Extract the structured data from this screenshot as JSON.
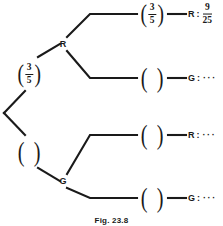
{
  "figure": {
    "caption": "Fig. 23.8",
    "stroke_color": "#1a1a1a",
    "background_color": "#ffffff"
  },
  "tree": {
    "root_branches": [
      {
        "id": "root-r",
        "probability": {
          "numerator": "3",
          "denominator": "5",
          "empty": false
        },
        "node_label": "R"
      },
      {
        "id": "root-g",
        "probability": {
          "numerator": "",
          "denominator": "",
          "empty": true
        },
        "node_label": "G"
      }
    ]
  },
  "outcomes": [
    {
      "id": "outcome-rr",
      "probability": {
        "numerator": "3",
        "denominator": "5",
        "empty": false
      },
      "letter": "R",
      "colon": ":",
      "result_numerator": "9",
      "result_denominator": "25",
      "result_dots": "",
      "has_result_fraction": true
    },
    {
      "id": "outcome-rg",
      "probability": {
        "numerator": "",
        "denominator": "",
        "empty": true
      },
      "letter": "G",
      "colon": ":",
      "result_numerator": "",
      "result_denominator": "",
      "result_dots": "···",
      "has_result_fraction": false
    },
    {
      "id": "outcome-gr",
      "probability": {
        "numerator": "",
        "denominator": "",
        "empty": true
      },
      "letter": "R",
      "colon": ":",
      "result_numerator": "",
      "result_denominator": "",
      "result_dots": "···",
      "has_result_fraction": false
    },
    {
      "id": "outcome-gg",
      "probability": {
        "numerator": "",
        "denominator": "",
        "empty": true
      },
      "letter": "G",
      "colon": ":",
      "result_numerator": "",
      "result_denominator": "",
      "result_dots": "···",
      "has_result_fraction": false
    }
  ]
}
